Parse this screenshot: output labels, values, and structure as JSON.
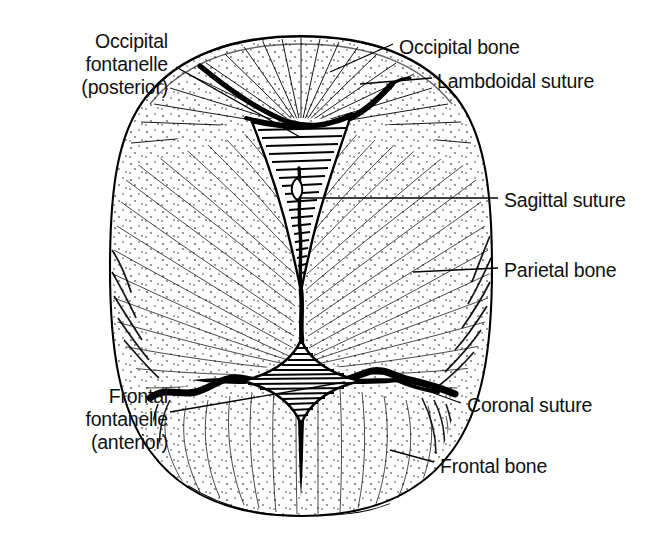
{
  "figure": {
    "background_color": "#ffffff",
    "ink_color": "#000000",
    "width": 669,
    "height": 541
  },
  "labels": {
    "occipital_fontanelle": "Occipital\nfontanelle\n(posterior)",
    "occipital_bone": "Occipital bone",
    "lambdoidal_suture": "Lambdoidal suture",
    "sagittal_suture": "Sagittal suture",
    "parietal_bone": "Parietal bone",
    "coronal_suture": "Coronal suture",
    "frontal_bone": "Frontal bone",
    "frontal_fontanelle": "Frontal\nfontanelle\n(anterior)"
  },
  "structures": [
    {
      "name": "occipital-fontanelle",
      "type": "fontanelle",
      "position": "posterior-midline"
    },
    {
      "name": "frontal-fontanelle",
      "type": "fontanelle",
      "position": "anterior-midline"
    },
    {
      "name": "occipital-bone",
      "type": "bone",
      "position": "posterior"
    },
    {
      "name": "parietal-bone-left",
      "type": "bone",
      "position": "left-lateral"
    },
    {
      "name": "parietal-bone-right",
      "type": "bone",
      "position": "right-lateral"
    },
    {
      "name": "frontal-bone",
      "type": "bone",
      "position": "anterior"
    },
    {
      "name": "lambdoidal-suture",
      "type": "suture",
      "position": "posterior-transverse"
    },
    {
      "name": "sagittal-suture",
      "type": "suture",
      "position": "midline-longitudinal"
    },
    {
      "name": "coronal-suture",
      "type": "suture",
      "position": "anterior-transverse"
    }
  ]
}
